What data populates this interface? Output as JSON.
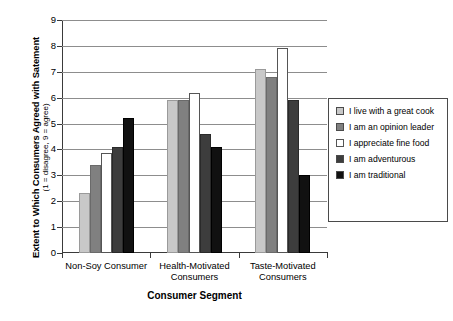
{
  "chart_data": {
    "type": "bar",
    "title": "",
    "xlabel": "Consumer Segment",
    "ylabel": "Extent to Which Consumers Agreed with Satement",
    "ylabel_sub": "(1 = disagree, 9 = agree)",
    "ylim": [
      0,
      9
    ],
    "yticks": [
      0,
      1,
      2,
      3,
      4,
      5,
      6,
      7,
      8,
      9
    ],
    "grid": true,
    "legend_position": "right",
    "categories": [
      "Non-Soy Consumer",
      "Health-Motivated Consumers",
      "Taste-Motivated Consumers"
    ],
    "series": [
      {
        "name": "I live with a great cook",
        "color": "#c8c8c8",
        "values": [
          2.3,
          5.9,
          7.1
        ]
      },
      {
        "name": "I am an opinion leader",
        "color": "#808080",
        "values": [
          3.4,
          5.9,
          6.8
        ]
      },
      {
        "name": "I appreciate fine food",
        "color": "#ffffff",
        "values": [
          3.85,
          6.2,
          7.9
        ]
      },
      {
        "name": "I am adventurous",
        "color": "#3d3d3d",
        "values": [
          4.1,
          4.6,
          5.9
        ]
      },
      {
        "name": "I am traditional",
        "color": "#111111",
        "values": [
          5.2,
          4.1,
          3.0
        ]
      }
    ]
  }
}
